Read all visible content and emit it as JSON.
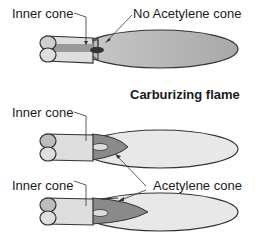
{
  "labels": {
    "top_inner_cone": "Inner cone",
    "top_no_acetylene": "No Acetylene cone",
    "section_title": "Carburizing flame",
    "mid_inner_cone": "Inner cone",
    "bottom_inner_cone": "Inner cone",
    "acetylene_cone": "Acetylene cone"
  },
  "colors": {
    "outer_flame_top": "#b0b0b0",
    "outer_flame_light": "#e6e6e6",
    "acetylene_cone": "#8a8a8a",
    "inner_cone": "#d8d8d8",
    "torch_tip": "#d4d4d4",
    "torch_band": "#a0a0a0",
    "outline": "#333333"
  }
}
